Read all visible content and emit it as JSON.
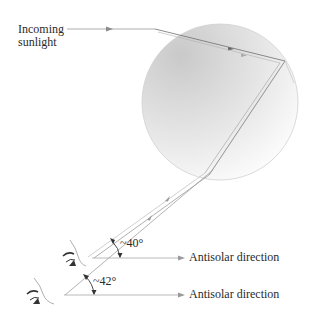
{
  "diagram": {
    "labels": {
      "incoming_line1": "Incoming",
      "incoming_line2": "sunlight",
      "antisolar_upper": "Antisolar direction",
      "antisolar_lower": "Antisolar direction",
      "angle_upper": "~40°",
      "angle_lower": "~42°"
    },
    "elements": {
      "raindrop": "circle-gradient",
      "incoming_ray": "arrow-right",
      "observer_upper": "eye-icon",
      "observer_lower": "eye-icon"
    },
    "colors": {
      "ray": "#8a8a8a",
      "ray_light": "#b5b5b5",
      "drop_edge": "#c8c8c8",
      "drop_fill_dark": "#d4d4d4",
      "drop_fill_light": "#ffffff",
      "text": "#2a2a2a"
    }
  }
}
